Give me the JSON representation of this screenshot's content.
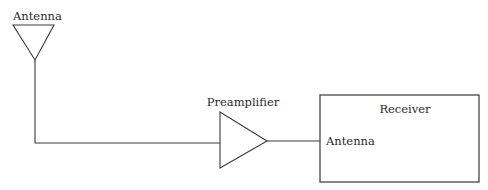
{
  "diagram": {
    "nodes": [
      {
        "id": "antenna",
        "type": "antenna-symbol",
        "label": "Antenna"
      },
      {
        "id": "preamplifier",
        "type": "amplifier-symbol",
        "label": "Preamplifier"
      },
      {
        "id": "receiver",
        "type": "block",
        "label": "Receiver",
        "port_label": "Antenna"
      }
    ],
    "edges": [
      {
        "from": "antenna",
        "to": "preamplifier"
      },
      {
        "from": "preamplifier",
        "to": "receiver"
      }
    ],
    "colors": {
      "line": "#3a3a3a",
      "box_border": "#555555",
      "text": "#2a2a2a",
      "background": "#ffffff"
    }
  }
}
